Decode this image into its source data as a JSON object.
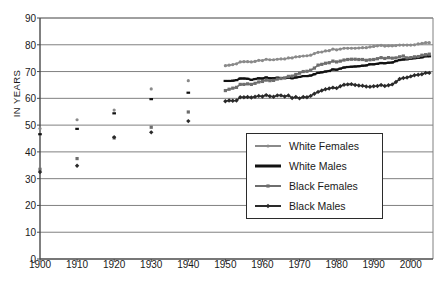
{
  "chart": {
    "type": "line",
    "ylabel": "IN YEARS",
    "title": "",
    "xlabel": ""
  },
  "axis": {
    "y_ticks": [
      "0",
      "10",
      "20",
      "30",
      "40",
      "50",
      "60",
      "70",
      "80",
      "90"
    ],
    "x_ticks": [
      "1900",
      "1910",
      "1920",
      "1930",
      "1940",
      "1950",
      "1960",
      "1970",
      "1980",
      "1990",
      "2000"
    ]
  },
  "legend": {
    "items": [
      {
        "label": "White Females",
        "color": "#8a8a8a",
        "marker": "dot"
      },
      {
        "label": "White Males",
        "color": "#111111",
        "marker": "line"
      },
      {
        "label": "Black Females",
        "color": "#6e6e6e",
        "marker": "square"
      },
      {
        "label": "Black Males",
        "color": "#2a2a2a",
        "marker": "diamond"
      }
    ]
  },
  "chart_data": {
    "type": "line",
    "title": "",
    "xlabel": "",
    "ylabel": "IN YEARS",
    "xlim": [
      1900,
      2006
    ],
    "ylim": [
      0,
      90
    ],
    "grid": true,
    "legend_position": "bottom-right",
    "x_ticks": [
      1900,
      1910,
      1920,
      1930,
      1940,
      1950,
      1960,
      1970,
      1980,
      1990,
      2000
    ],
    "y_ticks": [
      0,
      10,
      20,
      30,
      40,
      50,
      60,
      70,
      80,
      90
    ],
    "note": "Early decades 1900-1940 are discrete scatter points; 1950-2005 are continuous annual series with markers.",
    "scatter_x": [
      1900,
      1910,
      1920,
      1930,
      1940
    ],
    "series": [
      {
        "name": "White Females",
        "color": "#8a8a8a",
        "marker": "dot",
        "scatter_values": [
          48.7,
          52.0,
          55.6,
          63.5,
          66.6
        ],
        "x": [
          1950,
          1951,
          1952,
          1953,
          1954,
          1955,
          1956,
          1957,
          1958,
          1959,
          1960,
          1961,
          1962,
          1963,
          1964,
          1965,
          1966,
          1967,
          1968,
          1969,
          1970,
          1971,
          1972,
          1973,
          1974,
          1975,
          1976,
          1977,
          1978,
          1979,
          1980,
          1981,
          1982,
          1983,
          1984,
          1985,
          1986,
          1987,
          1988,
          1989,
          1990,
          1991,
          1992,
          1993,
          1994,
          1995,
          1996,
          1997,
          1998,
          1999,
          2000,
          2001,
          2002,
          2003,
          2004,
          2005
        ],
        "values": [
          72.2,
          72.4,
          72.6,
          72.9,
          73.6,
          73.7,
          73.7,
          73.6,
          73.8,
          74.2,
          74.1,
          74.6,
          74.4,
          74.4,
          74.6,
          74.7,
          74.7,
          75.1,
          75.1,
          75.5,
          75.6,
          75.8,
          75.9,
          76.1,
          76.7,
          77.2,
          77.3,
          77.7,
          77.8,
          78.4,
          78.1,
          78.4,
          78.7,
          78.7,
          78.7,
          78.7,
          78.8,
          78.9,
          78.9,
          79.2,
          79.4,
          79.6,
          79.8,
          79.5,
          79.6,
          79.6,
          79.7,
          79.9,
          79.9,
          79.9,
          79.9,
          80.0,
          80.3,
          80.5,
          80.8,
          80.8
        ]
      },
      {
        "name": "White Males",
        "color": "#111111",
        "marker": "line",
        "scatter_values": [
          46.6,
          48.6,
          54.4,
          59.7,
          62.1
        ],
        "x": [
          1950,
          1951,
          1952,
          1953,
          1954,
          1955,
          1956,
          1957,
          1958,
          1959,
          1960,
          1961,
          1962,
          1963,
          1964,
          1965,
          1966,
          1967,
          1968,
          1969,
          1970,
          1971,
          1972,
          1973,
          1974,
          1975,
          1976,
          1977,
          1978,
          1979,
          1980,
          1981,
          1982,
          1983,
          1984,
          1985,
          1986,
          1987,
          1988,
          1989,
          1990,
          1991,
          1992,
          1993,
          1994,
          1995,
          1996,
          1997,
          1998,
          1999,
          2000,
          2001,
          2002,
          2003,
          2004,
          2005
        ],
        "values": [
          66.5,
          66.5,
          66.6,
          66.8,
          67.4,
          67.4,
          67.3,
          66.9,
          67.2,
          67.5,
          67.4,
          67.8,
          67.5,
          67.5,
          67.7,
          67.6,
          67.6,
          67.8,
          67.5,
          67.8,
          68.0,
          68.3,
          68.3,
          68.5,
          69.0,
          69.5,
          69.7,
          70.0,
          70.2,
          70.8,
          70.7,
          71.1,
          71.5,
          71.7,
          71.8,
          71.9,
          72.0,
          72.2,
          72.3,
          72.7,
          72.7,
          72.9,
          73.2,
          73.1,
          73.3,
          73.4,
          73.9,
          74.3,
          74.5,
          74.6,
          74.8,
          75.0,
          75.1,
          75.3,
          75.7,
          75.7
        ]
      },
      {
        "name": "Black Females",
        "color": "#6e6e6e",
        "marker": "square",
        "scatter_values": [
          33.5,
          37.5,
          45.2,
          49.2,
          54.9
        ],
        "x": [
          1950,
          1951,
          1952,
          1953,
          1954,
          1955,
          1956,
          1957,
          1958,
          1959,
          1960,
          1961,
          1962,
          1963,
          1964,
          1965,
          1966,
          1967,
          1968,
          1969,
          1970,
          1971,
          1972,
          1973,
          1974,
          1975,
          1976,
          1977,
          1978,
          1979,
          1980,
          1981,
          1982,
          1983,
          1984,
          1985,
          1986,
          1987,
          1988,
          1989,
          1990,
          1991,
          1992,
          1993,
          1994,
          1995,
          1996,
          1997,
          1998,
          1999,
          2000,
          2001,
          2002,
          2003,
          2004,
          2005
        ],
        "values": [
          62.9,
          63.4,
          63.8,
          64.1,
          65.2,
          65.2,
          65.4,
          65.2,
          65.6,
          66.1,
          66.3,
          66.8,
          66.6,
          66.7,
          67.2,
          67.4,
          67.6,
          68.2,
          68.3,
          68.9,
          69.4,
          70.0,
          70.1,
          70.5,
          71.3,
          72.4,
          72.7,
          73.1,
          73.3,
          73.9,
          73.6,
          73.9,
          74.3,
          74.5,
          74.6,
          74.6,
          74.5,
          74.5,
          74.2,
          74.4,
          74.5,
          74.8,
          75.2,
          74.9,
          75.2,
          75.0,
          75.1,
          75.5,
          75.8,
          75.1,
          75.2,
          75.5,
          75.6,
          76.1,
          76.3,
          76.5
        ]
      },
      {
        "name": "Black Males",
        "color": "#2a2a2a",
        "marker": "diamond",
        "scatter_values": [
          32.5,
          34.8,
          45.5,
          47.3,
          51.5
        ],
        "x": [
          1950,
          1951,
          1952,
          1953,
          1954,
          1955,
          1956,
          1957,
          1958,
          1959,
          1960,
          1961,
          1962,
          1963,
          1964,
          1965,
          1966,
          1967,
          1968,
          1969,
          1970,
          1971,
          1972,
          1973,
          1974,
          1975,
          1976,
          1977,
          1978,
          1979,
          1980,
          1981,
          1982,
          1983,
          1984,
          1985,
          1986,
          1987,
          1988,
          1989,
          1990,
          1991,
          1992,
          1993,
          1994,
          1995,
          1996,
          1997,
          1998,
          1999,
          2000,
          2001,
          2002,
          2003,
          2004,
          2005
        ],
        "values": [
          58.9,
          59.2,
          59.1,
          59.2,
          60.4,
          60.4,
          60.5,
          60.3,
          60.6,
          60.9,
          60.7,
          61.2,
          60.8,
          60.6,
          61.1,
          61.1,
          60.7,
          61.1,
          60.1,
          60.5,
          60.0,
          60.5,
          60.4,
          60.9,
          61.7,
          62.4,
          62.9,
          63.4,
          63.7,
          64.0,
          63.8,
          64.5,
          65.1,
          65.2,
          65.3,
          65.0,
          64.8,
          64.7,
          64.4,
          64.3,
          64.5,
          64.6,
          65.0,
          64.6,
          64.9,
          65.2,
          66.1,
          67.2,
          67.6,
          67.8,
          68.2,
          68.6,
          68.8,
          69.0,
          69.5,
          69.5
        ]
      }
    ]
  }
}
